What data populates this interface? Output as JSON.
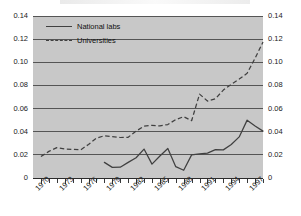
{
  "chart_data": {
    "type": "line",
    "title": "",
    "xlabel": "",
    "ylabel": "",
    "xlim": [
      1969,
      1998
    ],
    "ylim": [
      0,
      0.14
    ],
    "grid": true,
    "legend_position": "top-left",
    "y_ticks": [
      "0",
      "0.02",
      "0.04",
      "0.06",
      "0.08",
      "0.10",
      "0.12",
      "0.14"
    ],
    "y_tick_values": [
      0,
      0.02,
      0.04,
      0.06,
      0.08,
      0.1,
      0.12,
      0.14
    ],
    "y_axis_right_ticks": [
      "0",
      "0.02",
      "0.04",
      "0.06",
      "0.08",
      "0.10",
      "0.12",
      "0.14"
    ],
    "x_ticks": [
      "1970",
      "1973",
      "1976",
      "1979",
      "1982",
      "1985",
      "1988",
      "1991",
      "1994",
      "1997"
    ],
    "x_tick_values": [
      1970,
      1973,
      1976,
      1979,
      1982,
      1985,
      1988,
      1991,
      1994,
      1997
    ],
    "x_minor_tick_values": [
      1970,
      1971,
      1972,
      1973,
      1974,
      1975,
      1976,
      1977,
      1978,
      1979,
      1980,
      1981,
      1982,
      1983,
      1984,
      1985,
      1986,
      1987,
      1988,
      1989,
      1990,
      1991,
      1992,
      1993,
      1994,
      1995,
      1996,
      1997,
      1998
    ],
    "series": [
      {
        "name": "National labs",
        "style": "solid",
        "color": "#404040",
        "x": [
          1978,
          1979,
          1980,
          1981,
          1982,
          1983,
          1984,
          1985,
          1986,
          1987,
          1988,
          1989,
          1990,
          1991,
          1992,
          1993,
          1994,
          1995,
          1996,
          1997,
          1998
        ],
        "values": [
          0.0135,
          0.0092,
          0.0093,
          0.0135,
          0.0175,
          0.025,
          0.012,
          0.019,
          0.0255,
          0.0098,
          0.0067,
          0.02,
          0.0208,
          0.0215,
          0.0245,
          0.0243,
          0.029,
          0.0355,
          0.05,
          0.045,
          0.0405
        ]
      },
      {
        "name": "Universities",
        "style": "dashed",
        "color": "#404040",
        "x": [
          1970,
          1971,
          1972,
          1973,
          1974,
          1975,
          1976,
          1977,
          1978,
          1979,
          1980,
          1981,
          1982,
          1983,
          1984,
          1985,
          1986,
          1987,
          1988,
          1989,
          1990,
          1991,
          1992,
          1993,
          1994,
          1995,
          1996,
          1997,
          1998
        ],
        "values": [
          0.0185,
          0.023,
          0.0262,
          0.025,
          0.0248,
          0.0243,
          0.029,
          0.0345,
          0.0365,
          0.0358,
          0.035,
          0.0352,
          0.0405,
          0.0448,
          0.0455,
          0.045,
          0.0462,
          0.0505,
          0.053,
          0.0495,
          0.0725,
          0.0665,
          0.0685,
          0.076,
          0.081,
          0.0855,
          0.0905,
          0.1035,
          0.1175
        ]
      }
    ]
  },
  "legend": {
    "items": [
      {
        "label": "National labs",
        "style": "solid"
      },
      {
        "label": "Universities",
        "style": "dashed"
      }
    ]
  }
}
